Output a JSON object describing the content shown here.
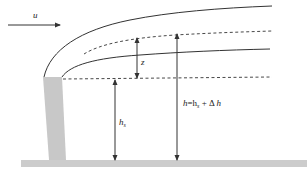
{
  "diagram": {
    "type": "plume-rise-schematic",
    "labels": {
      "wind_speed": "u",
      "rise_distance": "z",
      "stack_height_symbol": "h",
      "stack_height_sub": "s",
      "effective_height_lhs": "h",
      "effective_height_eq": "=h",
      "effective_height_sub": "s",
      "effective_height_plus": " + Δ ",
      "effective_height_delta": "h"
    },
    "caption": "",
    "colors": {
      "line": "#333333",
      "stack": "#c8c8c8",
      "ground": "#cccccc",
      "background": "#ffffff"
    },
    "elements": [
      "wind-arrow",
      "stack",
      "plume-upper-boundary",
      "plume-upper-centerline",
      "plume-lower-boundary",
      "stack-top-level-line",
      "rise-dimension",
      "stack-height-dimension",
      "effective-height-dimension",
      "ground"
    ]
  }
}
